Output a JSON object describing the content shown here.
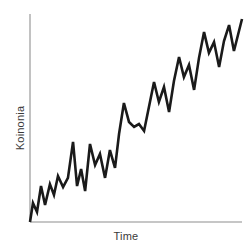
{
  "chart_data": {
    "type": "line",
    "title": "",
    "subtitle": "",
    "xlabel": "Time",
    "ylabel": "Koinonia",
    "grid": false,
    "legend": null,
    "legend_position": "none",
    "axis_color": "#b3b3b3",
    "line_color": "#1a1a1a",
    "line_width": 2.6,
    "background": "#ffffff",
    "xlim": [
      0,
      100
    ],
    "ylim": [
      0,
      100
    ],
    "xticks": [],
    "yticks": [],
    "xticklabels": [],
    "yticklabels": [],
    "annotations": [],
    "series": [
      {
        "name": "Koinonia",
        "x": [
          0,
          1.4,
          3.3,
          5.2,
          7.1,
          9.4,
          11.3,
          13.2,
          15.6,
          17.9,
          20.3,
          22.2,
          24.1,
          26.0,
          28.3,
          30.7,
          33.0,
          35.4,
          37.7,
          40.1,
          42.0,
          44.3,
          46.7,
          49.1,
          51.4,
          53.8,
          56.1,
          58.5,
          60.8,
          63.2,
          65.6,
          67.9,
          70.3,
          72.6,
          75.0,
          77.4,
          79.7,
          82.1,
          84.4,
          86.8,
          89.2,
          91.5,
          93.9,
          96.2,
          98.1,
          100
        ],
        "y": [
          0,
          9.1,
          4.8,
          17.3,
          8.2,
          18.2,
          13.0,
          22.1,
          16.8,
          21.2,
          38.5,
          17.3,
          25.5,
          14.9,
          37.5,
          27.4,
          32.7,
          21.2,
          34.6,
          26.0,
          42.3,
          57.2,
          48.1,
          45.7,
          47.1,
          43.8,
          55.3,
          67.3,
          57.7,
          64.9,
          52.9,
          67.8,
          79.3,
          69.7,
          75.5,
          63.5,
          78.8,
          91.3,
          81.3,
          86.5,
          74.5,
          87.0,
          94.7,
          82.2,
          89.9,
          97.6
        ]
      }
    ]
  },
  "chart": {
    "plot_area": {
      "left": 30,
      "right": 242,
      "top": 14,
      "bottom": 222
    }
  }
}
